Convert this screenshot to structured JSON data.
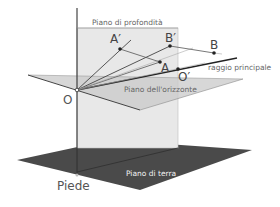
{
  "diagram": {
    "labels": {
      "depth_plane": "Piano di profondità",
      "horizon_plane": "Piano dell'orizzonte",
      "ground_plane": "Piano di terra",
      "principal_ray": "raggio principale",
      "foot": "Piede",
      "origin": "O",
      "origin_projection": "O′",
      "point_a": "A",
      "point_a_projection": "A′",
      "point_b": "B",
      "point_b_projection": "B′"
    },
    "colors": {
      "depth_plane_fill": "#e6e6e6",
      "horizon_plane_fill": "#cfcfcf",
      "ground_plane_fill": "#4a4a4a",
      "line": "#333333",
      "text": "#555555"
    }
  }
}
